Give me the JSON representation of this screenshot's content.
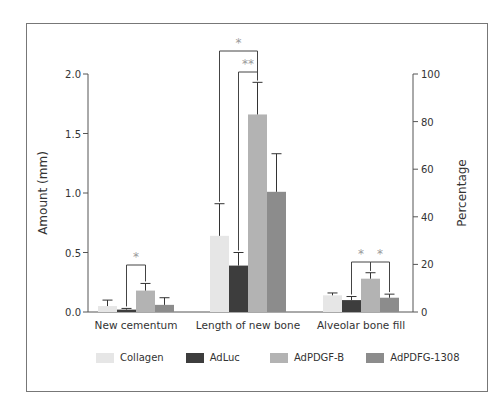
{
  "chart_data": {
    "type": "bar",
    "title": "",
    "categories": [
      "New cementum",
      "Length of new bone",
      "Alveolar bone fill"
    ],
    "xlabel": "",
    "ylabel": "Amount (mm)",
    "ylabel_right": "Percentage",
    "ylim": [
      0,
      2.0
    ],
    "ylim_right": [
      0,
      100
    ],
    "yticks": [
      "0.0",
      "0.5",
      "1.0",
      "1.5",
      "2.0"
    ],
    "yticks_right": [
      "0",
      "20",
      "40",
      "60",
      "80",
      "100"
    ],
    "axis_for_category": [
      "left",
      "left",
      "right"
    ],
    "grid": false,
    "legend_position": "bottom",
    "series": [
      {
        "name": "Collagen",
        "color": "#e6e6e6",
        "values": [
          0.05,
          0.64,
          7
        ],
        "error_upper": [
          0.1,
          0.91,
          8
        ]
      },
      {
        "name": "AdLuc",
        "color": "#3d3d3d",
        "values": [
          0.02,
          0.39,
          5
        ],
        "error_upper": [
          0.03,
          0.5,
          6.5
        ]
      },
      {
        "name": "AdPDGF-B",
        "color": "#b3b3b3",
        "values": [
          0.18,
          1.66,
          14
        ],
        "error_upper": [
          0.24,
          1.93,
          16.5
        ]
      },
      {
        "name": "AdPDFG-1308",
        "color": "#8c8c8c",
        "values": [
          0.06,
          1.01,
          6
        ],
        "error_upper": [
          0.12,
          1.33,
          7.5
        ]
      }
    ],
    "annotations": [
      {
        "category": "New cementum",
        "between": [
          "AdLuc",
          "AdPDGF-B"
        ],
        "label": "*"
      },
      {
        "category": "Length of new bone",
        "between": [
          "Collagen",
          "AdPDGF-B"
        ],
        "label": "*"
      },
      {
        "category": "Length of new bone",
        "between": [
          "AdLuc",
          "AdPDGF-B"
        ],
        "label": "**"
      },
      {
        "category": "Alveolar bone fill",
        "between": [
          "AdLuc",
          "AdPDGF-B"
        ],
        "label": "*"
      },
      {
        "category": "Alveolar bone fill",
        "between": [
          "AdPDGF-B",
          "AdPDFG-1308"
        ],
        "label": "*"
      }
    ]
  },
  "legend": {
    "items": [
      {
        "label": "Collagen",
        "color": "#e6e6e6"
      },
      {
        "label": "AdLuc",
        "color": "#3d3d3d"
      },
      {
        "label": "AdPDGF-B",
        "color": "#b3b3b3"
      },
      {
        "label": "AdPDFG-1308",
        "color": "#8c8c8c"
      }
    ]
  }
}
